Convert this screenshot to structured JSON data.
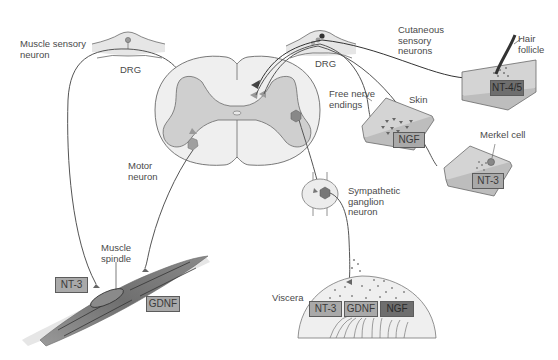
{
  "figure": {
    "labels": {
      "muscle_sensory_neuron": "Muscle sensory\nneuron",
      "drg_left": "DRG",
      "drg_right": "DRG",
      "cutaneous_sensory_neurons": "Cutaneous\nsensory\nneurons",
      "hair_follicle": "Hair\nfollicle",
      "free_nerve_endings": "Free nerve\nendings",
      "skin": "Skin",
      "merkel_cell": "Merkel cell",
      "motor_neuron": "Motor\nneuron",
      "sympathetic_ganglion_neuron": "Sympathetic\nganglion\nneuron",
      "muscle_spindle": "Muscle\nspindle",
      "viscera": "Viscera"
    },
    "factor_boxes": {
      "hair_follicle": "NT-4/5",
      "skin_free_endings": "NGF",
      "merkel": "NT-3",
      "muscle_nt3": "NT-3",
      "muscle_gdnf": "GDNF",
      "viscera_nt3": "NT-3",
      "viscera_gdnf": "GDNF",
      "viscera_ngf": "NGF"
    },
    "colors": {
      "outline": "#5a5a5a",
      "cord_white": "#efefef",
      "cord_gray": "#cfcfcf",
      "skin": "#d4d4d4",
      "muscle": "#7a7a7a",
      "box_light": "#a9a9a9",
      "box_dark": "#6e6e6e"
    }
  }
}
